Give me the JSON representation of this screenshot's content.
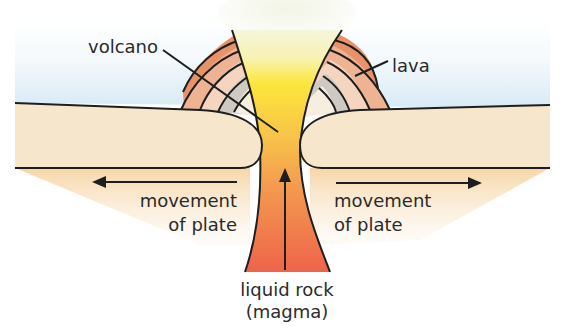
{
  "diagram": {
    "labels": {
      "volcano": "volcano",
      "lava": "lava",
      "movement_left_line1": "movement",
      "movement_left_line2": "of plate",
      "movement_right_line1": "movement",
      "movement_right_line2": "of plate",
      "magma_line1": "liquid rock",
      "magma_line2": "(magma)"
    },
    "arrows": {
      "left_plate": "points left",
      "right_plate": "points right",
      "magma": "points up"
    },
    "colors": {
      "sky_top": "#ffffff",
      "sky_bottom": "#dcecf7",
      "plate": "#f6e6cc",
      "ground_fade": "#f6d9ad",
      "magma_top": "#fbe642",
      "magma_mid": "#f6a84c",
      "magma_bottom": "#ee6a4a",
      "steam": "#f1f4e2",
      "lava_layer_1": "#e8926a",
      "lava_layer_2": "#eeb392",
      "lava_layer_3": "#f5d5c0",
      "lava_layer_4": "#cfc9c3",
      "lava_layer_5": "#f7eedf",
      "outline": "#1e1e1e",
      "text": "#2a2a2a"
    }
  }
}
